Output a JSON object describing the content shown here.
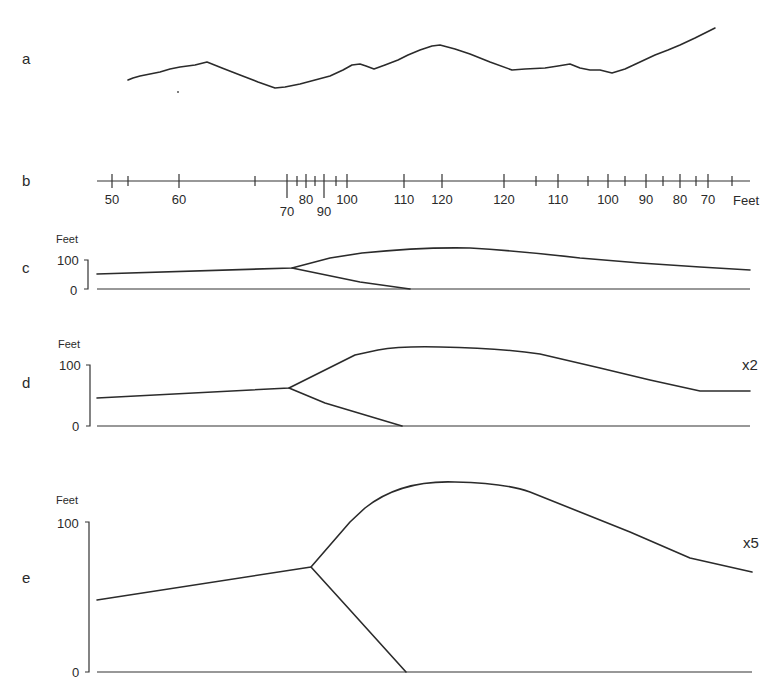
{
  "figure": {
    "panels": {
      "a": {
        "letter": "a",
        "description": "surface profile trace"
      },
      "b": {
        "letter": "b",
        "unit": "Feet",
        "ticks_major": [
          {
            "x": 112,
            "label": "50",
            "long": false
          },
          {
            "x": 179,
            "label": "60",
            "long": false
          },
          {
            "x": 287,
            "label": "70",
            "long": true,
            "below": true
          },
          {
            "x": 306,
            "label": "80",
            "long": false
          },
          {
            "x": 324,
            "label": "90",
            "long": true,
            "below": true
          },
          {
            "x": 347,
            "label": "100",
            "long": false
          },
          {
            "x": 404,
            "label": "110",
            "long": false
          },
          {
            "x": 442,
            "label": "120",
            "long": false
          },
          {
            "x": 504,
            "label": "120",
            "long": false
          },
          {
            "x": 558,
            "label": "110",
            "long": false
          },
          {
            "x": 608,
            "label": "100",
            "long": false
          },
          {
            "x": 646,
            "label": "90",
            "long": false
          },
          {
            "x": 680,
            "label": "80",
            "long": false
          },
          {
            "x": 708,
            "label": "70",
            "long": false
          }
        ],
        "ticks_minor": [
          128,
          255,
          297,
          315,
          336,
          536,
          588,
          625,
          663,
          696,
          732
        ]
      },
      "c": {
        "letter": "c",
        "y_unit": "Feet",
        "y_top": "100",
        "y_bottom": "0",
        "exaggeration": ""
      },
      "d": {
        "letter": "d",
        "y_unit": "Feet",
        "y_top": "100",
        "y_bottom": "0",
        "exaggeration": "x2"
      },
      "e": {
        "letter": "e",
        "y_unit": "Feet",
        "y_top": "100",
        "y_bottom": "0",
        "exaggeration": "x5"
      }
    }
  },
  "chart_data": [
    {
      "type": "line",
      "title": "a",
      "description": "Traced ground surface profile (unscaled)",
      "x": [
        128,
        150,
        180,
        207,
        240,
        275,
        300,
        330,
        352,
        363,
        375,
        400,
        420,
        440,
        470,
        512,
        545,
        570,
        590,
        612,
        630,
        660,
        690,
        715
      ],
      "y_px": [
        80,
        74,
        67,
        62,
        75,
        88,
        85,
        76,
        65,
        64,
        68,
        58,
        49,
        45,
        54,
        70,
        68,
        65,
        70,
        72,
        66,
        52,
        40,
        28
      ]
    },
    {
      "type": "line",
      "title": "c",
      "ylabel": "Feet",
      "ylim": [
        0,
        100
      ],
      "vertical_exaggeration": 1,
      "series": [
        {
          "name": "upper surface",
          "x_px": [
            95,
            292,
            362,
            470,
            750
          ],
          "y_ft": [
            38,
            55,
            88,
            98,
            50
          ]
        },
        {
          "name": "lower branch",
          "x_px": [
            292,
            410
          ],
          "y_ft": [
            55,
            0
          ]
        },
        {
          "name": "datum",
          "x_px": [
            95,
            750
          ],
          "y_ft": [
            0,
            0
          ]
        }
      ]
    },
    {
      "type": "line",
      "title": "d",
      "ylabel": "Feet",
      "ylim": [
        0,
        100
      ],
      "vertical_exaggeration": 2,
      "series": [
        {
          "name": "upper surface",
          "x_px": [
            95,
            289,
            380,
            470,
            750
          ],
          "y_ft": [
            48,
            62,
            96,
            98,
            55
          ]
        },
        {
          "name": "lower branch",
          "x_px": [
            289,
            402
          ],
          "y_ft": [
            62,
            0
          ]
        },
        {
          "name": "datum",
          "x_px": [
            95,
            750
          ],
          "y_ft": [
            0,
            0
          ]
        }
      ]
    },
    {
      "type": "line",
      "title": "e",
      "ylabel": "Feet",
      "ylim": [
        0,
        100
      ],
      "vertical_exaggeration": 5,
      "series": [
        {
          "name": "upper surface",
          "x_px": [
            97,
            311,
            365,
            460,
            530,
            750
          ],
          "y_ft": [
            46,
            71,
            101,
            117,
            112,
            71
          ]
        },
        {
          "name": "lower branch",
          "x_px": [
            311,
            406
          ],
          "y_ft": [
            71,
            0
          ]
        },
        {
          "name": "datum",
          "x_px": [
            97,
            750
          ],
          "y_ft": [
            0,
            0
          ]
        }
      ]
    }
  ]
}
